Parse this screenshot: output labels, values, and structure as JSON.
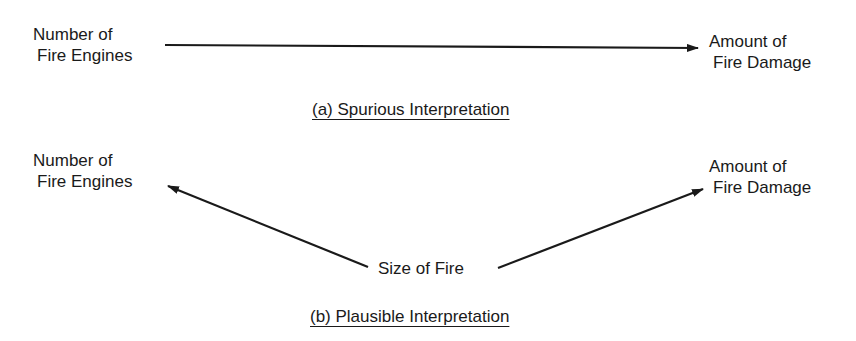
{
  "panel_a": {
    "left_node": {
      "line1": "Number of",
      "line2": "Fire Engines"
    },
    "right_node": {
      "line1": "Amount of",
      "line2": "Fire Damage"
    },
    "caption": "(a) Spurious Interpretation",
    "arrows": [
      {
        "from": "Number of Fire Engines",
        "to": "Amount of Fire Damage"
      }
    ]
  },
  "panel_b": {
    "left_node": {
      "line1": "Number of",
      "line2": "Fire Engines"
    },
    "right_node": {
      "line1": "Amount of",
      "line2": "Fire Damage"
    },
    "center_node": "Size of Fire",
    "caption": "(b) Plausible Interpretation",
    "arrows": [
      {
        "from": "Size of Fire",
        "to": "Number of Fire Engines"
      },
      {
        "from": "Size of Fire",
        "to": "Amount of Fire Damage"
      }
    ]
  },
  "colors": {
    "ink": "#1a1a1a",
    "background": "#ffffff"
  }
}
